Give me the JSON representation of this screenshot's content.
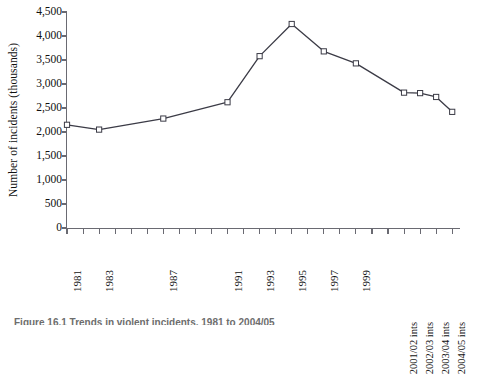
{
  "chart_data": {
    "type": "line",
    "title": "",
    "xlabel": "",
    "ylabel": "Number of incidents (thousands)",
    "ylim": [
      0,
      4500
    ],
    "ytick_values": [
      0,
      500,
      1000,
      1500,
      2000,
      2500,
      3000,
      3500,
      4000,
      4500
    ],
    "ytick_labels": [
      "0",
      "500",
      "1,000",
      "1,500",
      "2,000",
      "2,500",
      "3,000",
      "3,500",
      "4,000",
      "4,500"
    ],
    "grid": false,
    "legend": "none",
    "marker": "open-square",
    "line_color": "#3b3b46",
    "marker_fill": "#ffffff",
    "xtick_labels": [
      "1981",
      "1983",
      "1987",
      "1991",
      "1993",
      "1995",
      "1997",
      "1999",
      "2001/02 ints",
      "2002/03 ints",
      "2003/04 ints",
      "2004/05 ints"
    ],
    "categories": [
      "1981",
      "1983",
      "1987",
      "1991",
      "1993",
      "1995",
      "1997",
      "1999",
      "2001/02 ints",
      "2002/03 ints",
      "2003/04 ints",
      "2004/05 ints"
    ],
    "values": [
      2150,
      2050,
      2280,
      2620,
      3580,
      4250,
      3680,
      3430,
      2820,
      2810,
      2730,
      2420
    ],
    "x_index": [
      0,
      2,
      6,
      10,
      12,
      14,
      16,
      18,
      21,
      22,
      23,
      24
    ],
    "n_minor_ticks": 25,
    "axis_color": "#6a6a72"
  },
  "caption": {
    "text": "Figure 16.1 Trends in violent incidents, 1981 to 2004/05"
  }
}
